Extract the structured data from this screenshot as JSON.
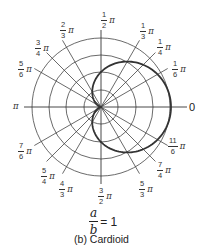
{
  "figure": {
    "caption": "(b) Cardioid",
    "ratio": {
      "numerator": "a",
      "denominator": "b",
      "equals": "= 1"
    },
    "pi_symbol": "π",
    "zero_label": "0",
    "pi_label": "π",
    "angle_labels": [
      {
        "id": "1-6",
        "num": "1",
        "den": "6"
      },
      {
        "id": "1-4",
        "num": "1",
        "den": "4"
      },
      {
        "id": "1-3",
        "num": "1",
        "den": "3"
      },
      {
        "id": "1-2",
        "num": "1",
        "den": "2"
      },
      {
        "id": "2-3",
        "num": "2",
        "den": "3"
      },
      {
        "id": "3-4",
        "num": "3",
        "den": "4"
      },
      {
        "id": "5-6",
        "num": "5",
        "den": "6"
      },
      {
        "id": "7-6",
        "num": "7",
        "den": "6"
      },
      {
        "id": "5-4",
        "num": "5",
        "den": "4"
      },
      {
        "id": "4-3",
        "num": "4",
        "den": "3"
      },
      {
        "id": "3-2",
        "num": "3",
        "den": "2"
      },
      {
        "id": "5-3",
        "num": "5",
        "den": "3"
      },
      {
        "id": "7-4",
        "num": "7",
        "den": "4"
      },
      {
        "id": "11-6",
        "num": "11",
        "den": "6"
      }
    ],
    "grid": {
      "center": [
        101,
        107
      ],
      "circle_radii": [
        17,
        35,
        52,
        69
      ],
      "radial_angles_deg": [
        0,
        30,
        45,
        60,
        90,
        120,
        135,
        150,
        180,
        210,
        225,
        240,
        270,
        300,
        315,
        330
      ],
      "radial_length": 77
    },
    "curve": {
      "type": "cardioid",
      "equation": "r = a(1 + cos θ)",
      "a_px": 35
    }
  }
}
